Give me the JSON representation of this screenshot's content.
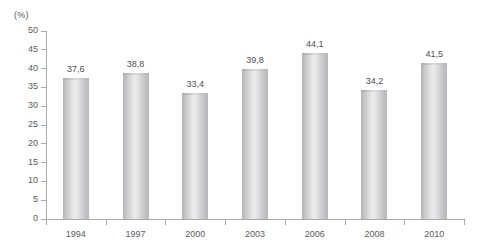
{
  "chart_data": {
    "type": "bar",
    "title": "",
    "subtitle": "",
    "xlabel": "",
    "ylabel": "(%)",
    "unit_label": "(%)",
    "categories": [
      "1994",
      "1997",
      "2000",
      "2003",
      "2006",
      "2008",
      "2010"
    ],
    "values": [
      37.6,
      38.8,
      33.4,
      39.8,
      44.1,
      34.2,
      41.5
    ],
    "value_labels": [
      "37,6",
      "38,8",
      "33,4",
      "39,8",
      "44,1",
      "34,2",
      "41,5"
    ],
    "ylim": [
      0,
      50
    ],
    "ytick_values": [
      0,
      5,
      10,
      15,
      20,
      25,
      30,
      35,
      40,
      45,
      50
    ],
    "ytick_labels": [
      "0",
      "5",
      "10",
      "15",
      "20",
      "25",
      "30",
      "35",
      "40",
      "45",
      "50"
    ],
    "grid": false,
    "legend": false,
    "legend_position": "none",
    "series": [
      {
        "name": "",
        "values": [
          37.6,
          38.8,
          33.4,
          39.8,
          44.1,
          34.2,
          41.5
        ]
      }
    ]
  },
  "colors": {
    "background": "#ffffff",
    "axis": "#a7a9ac",
    "tick_text": "#59595b",
    "value_text": "#4d4d4f",
    "bar_light": "#ececec",
    "bar_mid": "#cbcbcd",
    "bar_dark": "#b4b4b6"
  }
}
